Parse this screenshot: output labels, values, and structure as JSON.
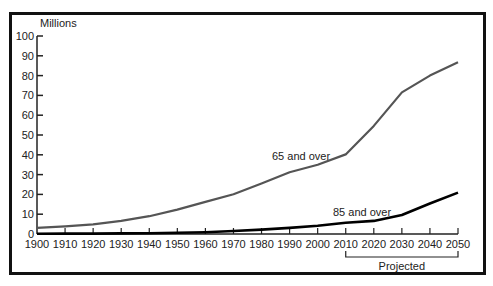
{
  "chart_data": {
    "type": "line",
    "title": "",
    "ylabel": "Millions",
    "xlabel": "",
    "ylim": [
      0,
      100
    ],
    "xlim": [
      1900,
      2050
    ],
    "grid": false,
    "yticks": [
      0,
      10,
      20,
      30,
      40,
      50,
      60,
      70,
      80,
      90,
      100
    ],
    "x": [
      1900,
      1910,
      1920,
      1930,
      1940,
      1950,
      1960,
      1970,
      1980,
      1990,
      2000,
      2010,
      2020,
      2030,
      2040,
      2050
    ],
    "series": [
      {
        "name": "65 and over",
        "color": "#555555",
        "values": [
          3.1,
          3.9,
          4.9,
          6.6,
          9.0,
          12.3,
          16.2,
          20.1,
          25.5,
          31.2,
          35.0,
          40.2,
          54.6,
          71.5,
          80.0,
          86.7
        ]
      },
      {
        "name": "85 and over",
        "color": "#000000",
        "values": [
          0.1,
          0.2,
          0.2,
          0.3,
          0.4,
          0.6,
          0.9,
          1.5,
          2.2,
          3.1,
          4.2,
          5.7,
          6.6,
          9.6,
          15.4,
          20.9
        ]
      }
    ],
    "annotations": [
      {
        "text": "65 and over",
        "near_x": 1990,
        "series": 0
      },
      {
        "text": "85 and over",
        "near_x": 2020,
        "series": 1
      },
      {
        "text": "Projected",
        "bracket_from": 2010,
        "bracket_to": 2050
      }
    ]
  }
}
